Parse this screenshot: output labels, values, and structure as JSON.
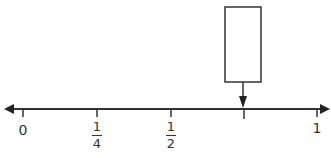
{
  "number_line": {
    "range": [
      0,
      1
    ],
    "ticks": [
      {
        "value": 0,
        "label": "0",
        "x": 23
      },
      {
        "value": 0.25,
        "numerator": "1",
        "denominator": "4",
        "x": 97
      },
      {
        "value": 0.5,
        "numerator": "1",
        "denominator": "2",
        "x": 171
      },
      {
        "value": 0.75,
        "label": "",
        "x": 244
      },
      {
        "value": 1,
        "label": "1",
        "x": 317
      }
    ],
    "answer_box": {
      "points_to": 0.75,
      "content": ""
    },
    "line_color": "#333333"
  }
}
